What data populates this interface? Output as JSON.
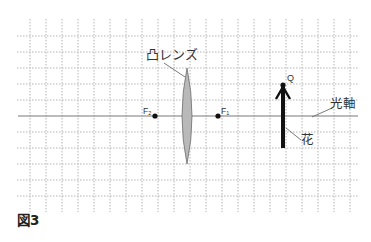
{
  "figure": {
    "caption": "図3",
    "grid": {
      "spacing_px": 16,
      "x_start": 17,
      "x_end": 358,
      "y_start": 19,
      "y_end": 212,
      "vertical_lines_x": [
        30,
        46,
        62,
        78,
        94,
        110,
        126,
        142,
        158,
        174,
        190,
        206,
        222,
        238,
        254,
        270,
        286,
        302,
        318,
        334,
        350
      ],
      "horizontal_lines_y": [
        36,
        52,
        68,
        84,
        100,
        132,
        148,
        164,
        180,
        196
      ],
      "line_color": "#b5b5b5",
      "style": "dotted"
    },
    "optical_axis": {
      "label": "光軸",
      "y": 116,
      "x_start": 18,
      "x_end": 358,
      "color": "#7a7a7a"
    },
    "lens": {
      "label": "凸レンズ",
      "type": "convex",
      "center_x": 187,
      "top_y": 68,
      "bottom_y": 164,
      "half_width": 5,
      "fill": "#b9b9b9"
    },
    "focal_points": [
      {
        "id": "F2",
        "label": "F",
        "subscript": "2",
        "x": 155,
        "y": 116
      },
      {
        "id": "F1",
        "label": "F",
        "subscript": "1",
        "x": 218,
        "y": 116
      }
    ],
    "object": {
      "label": "花",
      "point_label": "Q",
      "x": 283,
      "top_y": 84,
      "bottom_y": 148,
      "color": "#111111"
    }
  }
}
